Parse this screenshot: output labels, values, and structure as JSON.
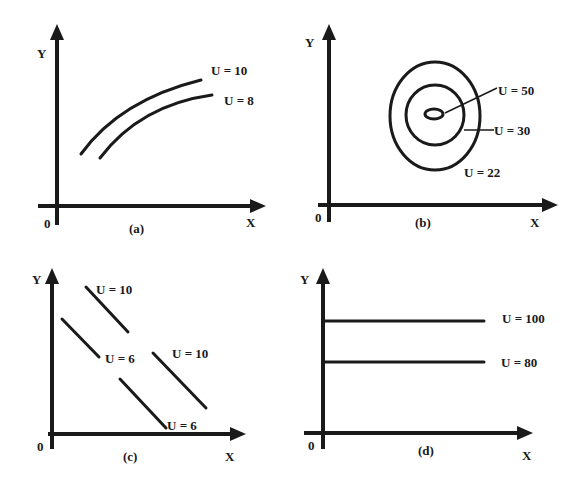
{
  "figure": {
    "panels": [
      {
        "id": "a",
        "caption": "(a)",
        "x_label": "X",
        "y_label": "Y",
        "origin": "0",
        "curves": [
          {
            "label": "U = 10"
          },
          {
            "label": "U = 8"
          }
        ]
      },
      {
        "id": "b",
        "caption": "(b)",
        "x_label": "X",
        "y_label": "Y",
        "origin": "0",
        "curves": [
          {
            "label": "U = 50"
          },
          {
            "label": "U = 30"
          },
          {
            "label": "U = 22"
          }
        ]
      },
      {
        "id": "c",
        "caption": "(c)",
        "x_label": "X",
        "y_label": "Y",
        "origin": "0",
        "curves": [
          {
            "label": "U = 10"
          },
          {
            "label": "U = 6"
          },
          {
            "label": "U = 10"
          },
          {
            "label": "U = 6"
          }
        ]
      },
      {
        "id": "d",
        "caption": "(d)",
        "x_label": "X",
        "y_label": "Y",
        "origin": "0",
        "curves": [
          {
            "label": "U = 100"
          },
          {
            "label": "U = 80"
          }
        ]
      }
    ]
  },
  "colors": {
    "ink": "#1a1a1a",
    "background": "#ffffff"
  }
}
